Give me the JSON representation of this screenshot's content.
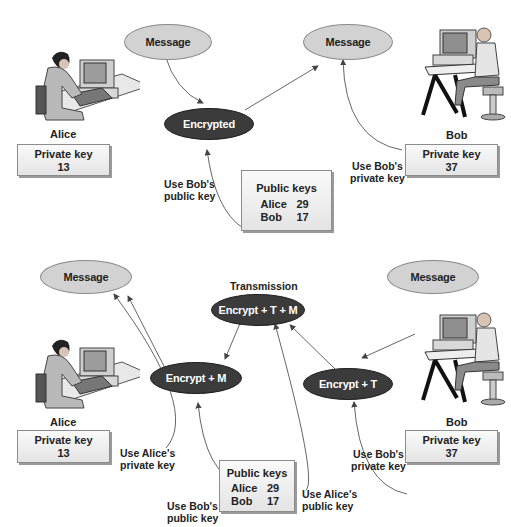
{
  "top_diagram": {
    "message_left": "Message",
    "message_right": "Message",
    "encrypted": "Encrypted",
    "alice": {
      "name": "Alice",
      "private_key_label": "Private key",
      "private_key_value": "13"
    },
    "bob": {
      "name": "Bob",
      "private_key_label": "Private key",
      "private_key_value": "37"
    },
    "public_keys": {
      "title": "Public keys",
      "rows": [
        {
          "name": "Alice",
          "value": "29"
        },
        {
          "name": "Bob",
          "value": "17"
        }
      ]
    },
    "use_bob_public_line1": "Use Bob's",
    "use_bob_public_line2": "public key",
    "use_bob_private_line1": "Use Bob's",
    "use_bob_private_line2": "private key"
  },
  "bottom_diagram": {
    "message_left": "Message",
    "message_right": "Message",
    "transmission_label": "Transmission",
    "encrypt_t_m": "Encrypt + T + M",
    "encrypt_m": "Encrypt + M",
    "encrypt_t": "Encrypt + T",
    "alice": {
      "name": "Alice",
      "private_key_label": "Private key",
      "private_key_value": "13"
    },
    "bob": {
      "name": "Bob",
      "private_key_label": "Private key",
      "private_key_value": "37"
    },
    "public_keys": {
      "title": "Public keys",
      "rows": [
        {
          "name": "Alice",
          "value": "29"
        },
        {
          "name": "Bob",
          "value": "17"
        }
      ]
    },
    "use_alice_private_line1": "Use Alice's",
    "use_alice_private_line2": "private key",
    "use_bob_public_line1": "Use Bob's",
    "use_bob_public_line2": "public key",
    "use_alice_public_line1": "Use Alice's",
    "use_alice_public_line2": "public key",
    "use_bob_private_line1": "Use Bob's",
    "use_bob_private_line2": "private key"
  },
  "colors": {
    "light_node": "#d2d2d2",
    "dark_node": "#3b3b3b",
    "arrow": "#555555"
  }
}
